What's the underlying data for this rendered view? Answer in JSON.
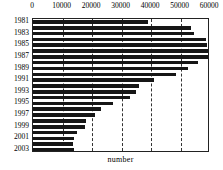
{
  "chart_data": {
    "type": "bar",
    "orientation": "horizontal",
    "title": "",
    "xlabel": "number",
    "ylabel": "",
    "xlim": [
      0,
      60000
    ],
    "ylim": null,
    "grid": true,
    "grid_style": "dashed vertical",
    "legend": null,
    "xticks": [
      0,
      10000,
      20000,
      30000,
      40000,
      50000,
      60000
    ],
    "xtick_labels": [
      "0",
      "10000",
      "20000",
      "30000",
      "40000",
      "50000",
      "60000"
    ],
    "categories": [
      "1981",
      "1982",
      "1983",
      "1984",
      "1985",
      "1986",
      "1987",
      "1988",
      "1989",
      "1990",
      "1991",
      "1992",
      "1993",
      "1994",
      "1995",
      "1996",
      "1997",
      "1998",
      "1999",
      "2000",
      "2001",
      "2002",
      "2003"
    ],
    "ytick_labels": [
      "1981",
      "1983",
      "1985",
      "1987",
      "1989",
      "1991",
      "1993",
      "1995",
      "1997",
      "1999",
      "2001",
      "2003"
    ],
    "values": [
      39000,
      53500,
      54500,
      58500,
      59000,
      59500,
      59300,
      55800,
      52500,
      48500,
      41000,
      36000,
      35000,
      33000,
      27000,
      23000,
      21000,
      18000,
      17500,
      15000,
      14000,
      13500,
      14000
    ],
    "bar_color": "#161616",
    "series": [
      {
        "name": "number",
        "values": [
          39000,
          53500,
          54500,
          58500,
          59000,
          59500,
          59300,
          55800,
          52500,
          48500,
          41000,
          36000,
          35000,
          33000,
          27000,
          23000,
          21000,
          18000,
          17500,
          15000,
          14000,
          13500,
          14000
        ]
      }
    ]
  }
}
